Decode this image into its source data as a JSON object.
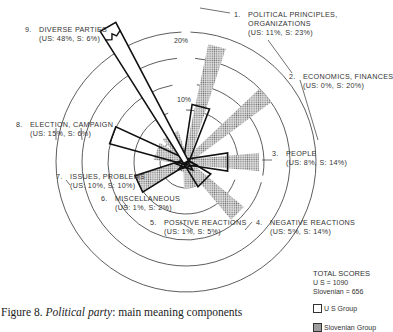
{
  "chart_data": {
    "type": "radial-bar",
    "title": "Figure 8. Political party: main meaning components",
    "caption_prefix": "Figure 8. ",
    "caption_italic": "Political party",
    "caption_suffix": ": main meaning components",
    "scale_ticks": [
      "10%",
      "20%"
    ],
    "ring_step_percent": 5,
    "series": [
      {
        "name": "U S Group",
        "style": "outline",
        "color": "#1a1a1a"
      },
      {
        "name": "Slovenian Group",
        "style": "dotted-fill",
        "color": "#9a9a9a"
      }
    ],
    "categories": [
      {
        "num": "1.",
        "label": "POLITICAL PRINCIPLES,",
        "label2": "ORGANIZATIONS",
        "values_text": "(US:  11%, S:  23%)",
        "us": 11,
        "s": 23,
        "angle": 15
      },
      {
        "num": "2.",
        "label": "ECONOMICS, FINANCES",
        "values_text": "(US:  0%, S:  20%)",
        "us": 0,
        "s": 20,
        "angle": 50
      },
      {
        "num": "3.",
        "label": "PEOPLE",
        "values_text": "(US:  8%, S:  14%)",
        "us": 8,
        "s": 14,
        "angle": 90
      },
      {
        "num": "4.",
        "label": "NEGATIVE REACTIONS",
        "values_text": "(US:  5%, S:  14%)",
        "us": 5,
        "s": 14,
        "angle": 135
      },
      {
        "num": "5.",
        "label": "POSITIVE REACTIONS",
        "values_text": "(US:  1%, S:  5%)",
        "us": 1,
        "s": 5,
        "angle": 165
      },
      {
        "num": "6.",
        "label": "MISCELLANEOUS",
        "values_text": "(US:  1%, S:  2%)",
        "us": 1,
        "s": 2,
        "angle": 200
      },
      {
        "num": "7.",
        "label": "ISSUES, PROBLEMS",
        "values_text": "(US:  10%, S:  10%)",
        "us": 10,
        "s": 10,
        "angle": 245
      },
      {
        "num": "8.",
        "label": "ELECTION, CAMPAIGN",
        "values_text": "(US:  15%, S:  6%)",
        "us": 15,
        "s": 6,
        "angle": 290
      },
      {
        "num": "9.",
        "label": "DIVERSE PARTIES",
        "values_text": "(US:  48%, S:  6%)",
        "us": 48,
        "s": 6,
        "angle": 330,
        "truncated": true
      }
    ]
  },
  "totals": {
    "title": "TOTAL SCORES",
    "us_line": "U S  = 1090",
    "slovenian_line": "Slovenian = 656"
  },
  "legend": {
    "us_label": "U S  Group",
    "slovenian_label": "Slovenian Group"
  }
}
